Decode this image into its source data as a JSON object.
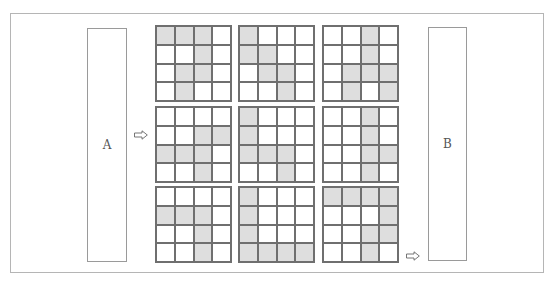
{
  "diagram": {
    "input_label": "A",
    "output_label": "B",
    "arrows": [
      "arrow-right",
      "arrow-right"
    ],
    "shade_color": "#dedede",
    "line_color": "#6f6f6f",
    "grids": [
      {
        "cells": [
          [
            1,
            1,
            1,
            0
          ],
          [
            0,
            0,
            1,
            0
          ],
          [
            0,
            1,
            1,
            0
          ],
          [
            0,
            1,
            0,
            0
          ]
        ]
      },
      {
        "cells": [
          [
            1,
            0,
            0,
            0
          ],
          [
            1,
            1,
            0,
            0
          ],
          [
            0,
            1,
            1,
            0
          ],
          [
            0,
            0,
            1,
            0
          ]
        ]
      },
      {
        "cells": [
          [
            0,
            0,
            1,
            0
          ],
          [
            0,
            0,
            1,
            0
          ],
          [
            0,
            1,
            1,
            1
          ],
          [
            0,
            1,
            0,
            1
          ]
        ]
      },
      {
        "cells": [
          [
            0,
            0,
            0,
            0
          ],
          [
            0,
            0,
            1,
            1
          ],
          [
            1,
            1,
            1,
            0
          ],
          [
            0,
            0,
            1,
            0
          ]
        ]
      },
      {
        "cells": [
          [
            1,
            0,
            0,
            0
          ],
          [
            1,
            0,
            0,
            0
          ],
          [
            1,
            1,
            1,
            0
          ],
          [
            0,
            0,
            1,
            0
          ]
        ]
      },
      {
        "cells": [
          [
            0,
            0,
            1,
            0
          ],
          [
            0,
            0,
            1,
            0
          ],
          [
            0,
            0,
            1,
            1
          ],
          [
            0,
            0,
            1,
            0
          ]
        ]
      },
      {
        "cells": [
          [
            0,
            0,
            0,
            0
          ],
          [
            1,
            1,
            1,
            0
          ],
          [
            0,
            0,
            1,
            0
          ],
          [
            0,
            0,
            1,
            0
          ]
        ]
      },
      {
        "cells": [
          [
            1,
            0,
            0,
            0
          ],
          [
            1,
            0,
            0,
            0
          ],
          [
            1,
            0,
            0,
            0
          ],
          [
            1,
            1,
            1,
            1
          ]
        ]
      },
      {
        "cells": [
          [
            1,
            1,
            1,
            1
          ],
          [
            0,
            0,
            0,
            1
          ],
          [
            0,
            0,
            1,
            1
          ],
          [
            0,
            0,
            1,
            0
          ]
        ]
      }
    ]
  }
}
